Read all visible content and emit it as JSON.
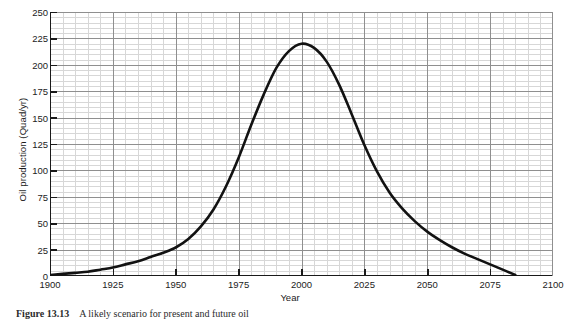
{
  "figure": {
    "caption_number": "Figure 13.13",
    "caption_text": "A likely scenario for present and future oil"
  },
  "axes": {
    "ylabel": "Oil production (Quad/yr)",
    "xlabel": "Year",
    "yticklabels": [
      "0",
      "25",
      "50",
      "75",
      "100",
      "125",
      "150",
      "175",
      "200",
      "225",
      "250"
    ],
    "xticklabels": [
      "1900",
      "1925",
      "1950",
      "1975",
      "2000",
      "2025",
      "2050",
      "2075",
      "2100"
    ]
  },
  "style": {
    "curve_color": "#121212",
    "major_grid_color": "#8f8f8f",
    "minor_grid_color": "#d7d7d7",
    "axis_color": "#1a1a1a",
    "background": "#ffffff"
  },
  "chart_data": {
    "type": "line",
    "title": "",
    "xlabel": "Year",
    "ylabel": "Oil production (Quad/yr)",
    "xlim": [
      1900,
      2100
    ],
    "ylim": [
      0,
      250
    ],
    "xticks": [
      1900,
      1925,
      1950,
      1975,
      2000,
      2025,
      2050,
      2075,
      2100
    ],
    "yticks": [
      0,
      25,
      50,
      75,
      100,
      125,
      150,
      175,
      200,
      225,
      250
    ],
    "grid": true,
    "minor_grid": true,
    "minor_tick_x": 5,
    "minor_tick_y": 5,
    "legend": false,
    "annotations": [],
    "series": [
      {
        "name": "Oil production",
        "peak_year": 2000,
        "peak_value": 220,
        "x": [
          1900,
          1905,
          1910,
          1915,
          1920,
          1925,
          1930,
          1935,
          1940,
          1945,
          1950,
          1955,
          1960,
          1965,
          1970,
          1975,
          1980,
          1985,
          1990,
          1995,
          2000,
          2005,
          2010,
          2015,
          2020,
          2025,
          2030,
          2035,
          2040,
          2045,
          2050,
          2055,
          2060,
          2065,
          2070,
          2075,
          2080,
          2085
        ],
        "y": [
          1,
          2,
          3,
          4,
          6,
          8,
          11,
          14,
          18,
          22,
          27,
          35,
          47,
          63,
          85,
          112,
          143,
          172,
          197,
          213,
          220,
          216,
          203,
          181,
          153,
          124,
          99,
          79,
          64,
          52,
          42,
          34,
          27,
          21,
          16,
          11,
          6,
          1
        ]
      }
    ]
  }
}
